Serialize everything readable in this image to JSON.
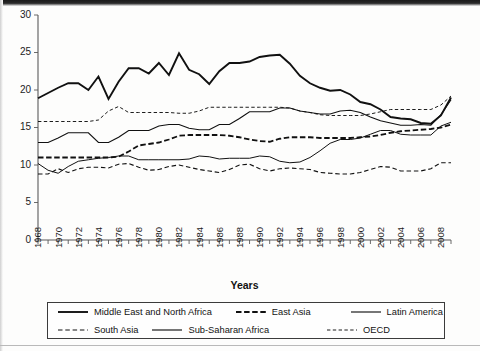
{
  "figure": {
    "background_color": "#fdfdfc",
    "line_color": "#111111",
    "axis_color": "#5a5a5a"
  },
  "axis": {
    "x_title": "Years",
    "y_ticks": [
      "0",
      "5",
      "10",
      "15",
      "20",
      "25",
      "30"
    ],
    "x_ticks": [
      "1968",
      "1970",
      "1972",
      "1974",
      "1976",
      "1978",
      "1980",
      "1982",
      "1984",
      "1986",
      "1988",
      "1990",
      "1992",
      "1994",
      "1996",
      "1998",
      "2000",
      "2002",
      "2004",
      "2006",
      "2008"
    ]
  },
  "legend": {
    "rows": [
      [
        {
          "label": "Middle East and North Africa",
          "style": "thick-solid"
        },
        {
          "label": "East Asia",
          "style": "thick-dashed"
        },
        {
          "label": "Latin America",
          "style": "solid"
        }
      ],
      [
        {
          "label": "South Asia",
          "style": "dashed"
        },
        {
          "label": "Sub-Saharan Africa",
          "style": "solid"
        },
        {
          "label": "OECD",
          "style": "fine-dashed"
        }
      ]
    ]
  },
  "chart_data": {
    "type": "line",
    "title": "",
    "subtitle": "",
    "xlabel": "Years",
    "ylabel": "",
    "xlim": [
      1968,
      2009
    ],
    "ylim": [
      0,
      30
    ],
    "grid": false,
    "legend_position": "bottom",
    "x": [
      1968,
      1969,
      1970,
      1971,
      1972,
      1973,
      1974,
      1975,
      1976,
      1977,
      1978,
      1979,
      1980,
      1981,
      1982,
      1983,
      1984,
      1985,
      1986,
      1987,
      1988,
      1989,
      1990,
      1991,
      1992,
      1993,
      1994,
      1995,
      1996,
      1997,
      1998,
      1999,
      2000,
      2001,
      2002,
      2003,
      2004,
      2005,
      2006,
      2007,
      2008,
      2009
    ],
    "series": [
      {
        "name": "Middle East and North Africa",
        "style": "thick-solid",
        "values": [
          18.9,
          19.6,
          20.3,
          20.9,
          20.9,
          20.0,
          21.8,
          18.8,
          21.1,
          22.9,
          22.9,
          22.2,
          23.6,
          22.0,
          24.9,
          22.7,
          22.1,
          20.8,
          22.5,
          23.6,
          23.6,
          23.8,
          24.4,
          24.6,
          24.7,
          23.5,
          21.9,
          20.9,
          20.3,
          19.9,
          20.0,
          19.4,
          18.4,
          18.1,
          17.4,
          16.4,
          16.2,
          16.1,
          15.6,
          15.5,
          16.6,
          19.0
        ]
      },
      {
        "name": "East Asia",
        "style": "thick-dashed",
        "values": [
          11.0,
          11.0,
          11.0,
          11.0,
          11.0,
          11.0,
          11.0,
          11.0,
          11.1,
          11.8,
          12.6,
          12.8,
          13.0,
          13.4,
          13.9,
          14.0,
          14.0,
          14.0,
          14.0,
          13.9,
          13.7,
          13.4,
          13.2,
          13.1,
          13.5,
          13.7,
          13.7,
          13.7,
          13.6,
          13.6,
          13.6,
          13.6,
          13.7,
          13.8,
          14.0,
          14.3,
          14.5,
          14.6,
          14.7,
          14.8,
          15.0,
          15.4
        ]
      },
      {
        "name": "Latin America",
        "style": "solid",
        "values": [
          13.0,
          13.0,
          13.6,
          14.3,
          14.3,
          14.3,
          13.0,
          13.0,
          13.7,
          14.6,
          14.6,
          14.6,
          15.2,
          15.4,
          15.4,
          14.9,
          14.7,
          14.7,
          15.4,
          15.4,
          16.2,
          17.1,
          17.1,
          17.1,
          17.6,
          17.6,
          17.2,
          17.0,
          16.8,
          16.8,
          17.2,
          17.3,
          17.0,
          16.4,
          15.9,
          15.6,
          15.3,
          15.3,
          15.4,
          15.3,
          16.7,
          18.7
        ]
      },
      {
        "name": "South Asia",
        "style": "dashed",
        "values": [
          8.8,
          8.8,
          9.5,
          9.0,
          9.5,
          9.7,
          9.7,
          9.6,
          10.1,
          10.2,
          9.7,
          9.3,
          9.4,
          9.8,
          10.0,
          9.7,
          9.4,
          9.2,
          9.0,
          9.4,
          10.0,
          10.1,
          9.5,
          9.2,
          9.5,
          9.6,
          9.5,
          9.4,
          9.0,
          8.9,
          8.8,
          8.8,
          9.0,
          9.4,
          9.8,
          9.7,
          9.2,
          9.2,
          9.2,
          9.5,
          10.3,
          10.3
        ]
      },
      {
        "name": "Sub-Saharan Africa",
        "style": "solid",
        "values": [
          10.2,
          9.3,
          8.9,
          9.8,
          10.5,
          10.7,
          10.9,
          11.0,
          11.2,
          11.2,
          10.7,
          10.7,
          10.7,
          10.7,
          10.7,
          10.8,
          11.2,
          11.1,
          10.8,
          10.9,
          10.9,
          10.9,
          11.2,
          11.1,
          10.5,
          10.3,
          10.4,
          11.0,
          11.9,
          12.9,
          13.4,
          13.4,
          13.6,
          14.1,
          14.6,
          14.6,
          14.1,
          14.0,
          14.0,
          14.0,
          15.2,
          15.7
        ]
      },
      {
        "name": "OECD",
        "style": "fine-dashed",
        "values": [
          15.8,
          15.8,
          15.8,
          15.8,
          15.8,
          15.8,
          16.0,
          17.2,
          17.8,
          17.0,
          17.0,
          17.0,
          17.0,
          17.0,
          16.9,
          16.9,
          17.2,
          17.7,
          17.7,
          17.7,
          17.7,
          17.7,
          17.7,
          17.7,
          17.7,
          17.6,
          17.2,
          17.0,
          16.7,
          16.6,
          16.6,
          16.6,
          16.6,
          16.8,
          17.1,
          17.4,
          17.4,
          17.4,
          17.4,
          17.4,
          18.0,
          19.2
        ]
      }
    ]
  }
}
